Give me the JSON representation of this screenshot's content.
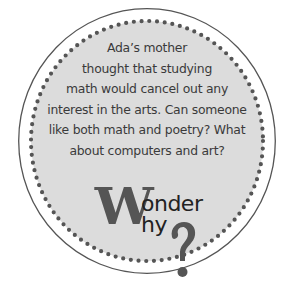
{
  "callout": {
    "lines": [
      "Ada’s mother",
      "thought that studying",
      "math would cancel out any",
      "interest in the arts. Can someone",
      "like both math and poetry? What",
      "about computers and art?"
    ]
  },
  "logo": {
    "big_letter": "W",
    "line1": "onder",
    "line2": "hy",
    "question_mark": "?"
  },
  "colors": {
    "circle_fill": "#dcdcdc",
    "circle_outline": "#555555",
    "dots": "#555555",
    "text": "#3a3a3a",
    "logo_w": "#555555",
    "logo_text": "#222222"
  }
}
